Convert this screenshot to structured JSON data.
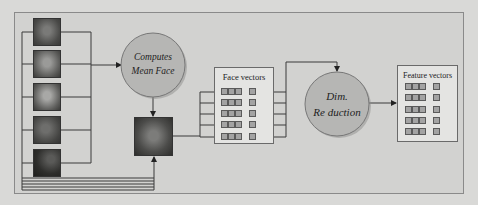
{
  "diagram": {
    "nodes": {
      "input_faces": {
        "label": "Input face images",
        "count": 5
      },
      "compute_mean": {
        "label_line1": "Computes",
        "label_line2": "Mean Face"
      },
      "mean_face": {
        "label": "Mean face image"
      },
      "face_vectors": {
        "label": "Face vectors",
        "rows": 5
      },
      "dim_reduction": {
        "label_line1": "Dim.",
        "label_line2": "Re duction"
      },
      "feature_vectors": {
        "label": "Feature vectors",
        "rows": 5
      }
    },
    "edges": [
      {
        "from": "input_faces",
        "to": "compute_mean"
      },
      {
        "from": "compute_mean",
        "to": "mean_face"
      },
      {
        "from": "input_faces",
        "to": "mean_face"
      },
      {
        "from": "mean_face",
        "to": "face_vectors"
      },
      {
        "from": "face_vectors",
        "to": "dim_reduction"
      },
      {
        "from": "dim_reduction",
        "to": "feature_vectors"
      }
    ],
    "colors": {
      "circle_fill": "#b4b4b2",
      "circle_stroke": "#777777",
      "cell_fill": "#a3a3a3",
      "line": "#3a3a3a"
    }
  }
}
